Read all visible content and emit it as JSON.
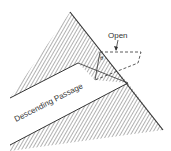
{
  "diagram": {
    "labels": {
      "open": "Open",
      "passage": "Descending Passage",
      "angle_symbol": "θ"
    },
    "colors": {
      "line": "#333333",
      "hatch": "#555555",
      "background": "#ffffff"
    }
  }
}
